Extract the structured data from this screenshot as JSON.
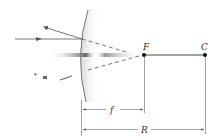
{
  "diagram": {
    "type": "convex mirror ray diagram",
    "labels": {
      "focal_point": "F",
      "center_of_curvature": "C",
      "focal_length": "f",
      "radius": "R"
    },
    "colors": {
      "ray": "#555555",
      "axis": "#444444",
      "mirror_edge": "#777777",
      "mirror_fill": "#e6e6e6"
    }
  }
}
